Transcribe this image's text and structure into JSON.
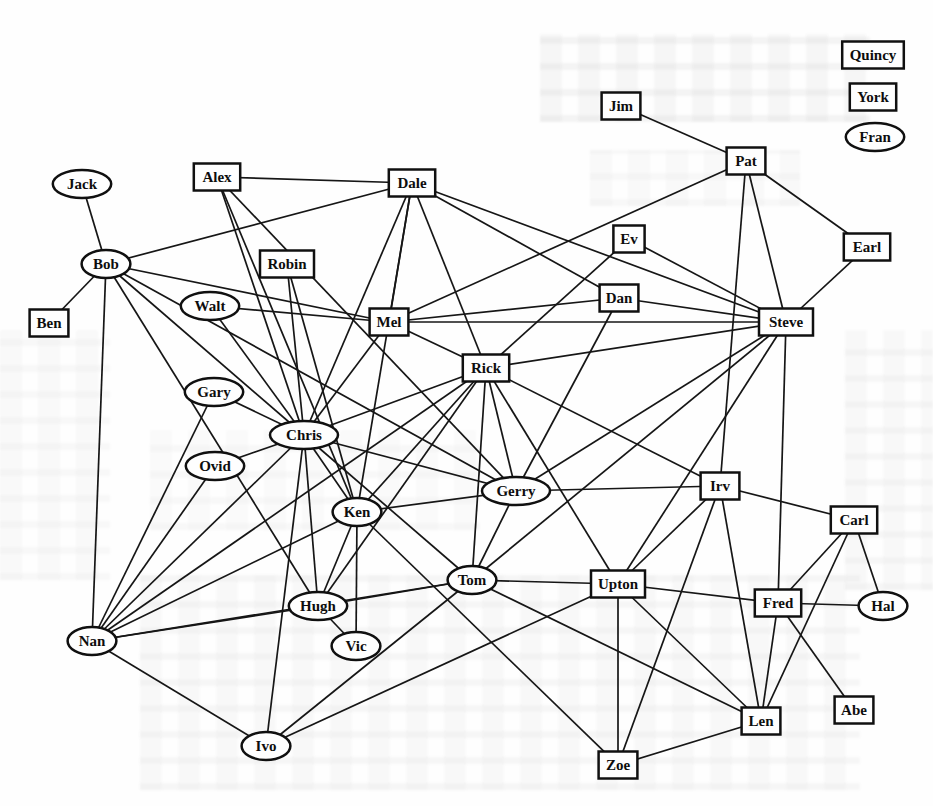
{
  "figure": {
    "kind": "scanned sociogram figure",
    "ink_color": "#161616",
    "paper_color": "#fefefe",
    "node_shapes_legend": "rectangle and ellipse node styles"
  },
  "graph": {
    "nodes": [
      {
        "id": "quincy",
        "label": "Quincy",
        "shape": "rect",
        "x": 873,
        "y": 55
      },
      {
        "id": "york",
        "label": "York",
        "shape": "rect",
        "x": 873,
        "y": 97
      },
      {
        "id": "fran",
        "label": "Fran",
        "shape": "ellipse",
        "x": 875,
        "y": 137
      },
      {
        "id": "jim",
        "label": "Jim",
        "shape": "rect",
        "x": 621,
        "y": 106
      },
      {
        "id": "pat",
        "label": "Pat",
        "shape": "rect",
        "x": 746,
        "y": 161
      },
      {
        "id": "jack",
        "label": "Jack",
        "shape": "ellipse",
        "x": 82,
        "y": 184
      },
      {
        "id": "alex",
        "label": "Alex",
        "shape": "rect",
        "x": 217,
        "y": 177
      },
      {
        "id": "dale",
        "label": "Dale",
        "shape": "rect",
        "x": 412,
        "y": 183
      },
      {
        "id": "ev",
        "label": "Ev",
        "shape": "rect",
        "x": 629,
        "y": 239
      },
      {
        "id": "earl",
        "label": "Earl",
        "shape": "rect",
        "x": 867,
        "y": 247
      },
      {
        "id": "bob",
        "label": "Bob",
        "shape": "ellipse",
        "x": 106,
        "y": 264
      },
      {
        "id": "robin",
        "label": "Robin",
        "shape": "rect",
        "x": 287,
        "y": 264
      },
      {
        "id": "ben",
        "label": "Ben",
        "shape": "rect",
        "x": 49,
        "y": 323
      },
      {
        "id": "walt",
        "label": "Walt",
        "shape": "ellipse",
        "x": 210,
        "y": 306
      },
      {
        "id": "mel",
        "label": "Mel",
        "shape": "rect",
        "x": 389,
        "y": 322
      },
      {
        "id": "dan",
        "label": "Dan",
        "shape": "rect",
        "x": 619,
        "y": 298
      },
      {
        "id": "steve",
        "label": "Steve",
        "shape": "rect",
        "x": 786,
        "y": 322
      },
      {
        "id": "rick",
        "label": "Rick",
        "shape": "rect",
        "x": 486,
        "y": 368
      },
      {
        "id": "gary",
        "label": "Gary",
        "shape": "ellipse",
        "x": 214,
        "y": 392
      },
      {
        "id": "chris",
        "label": "Chris",
        "shape": "ellipse",
        "x": 304,
        "y": 435
      },
      {
        "id": "ovid",
        "label": "Ovid",
        "shape": "ellipse",
        "x": 215,
        "y": 466
      },
      {
        "id": "ken",
        "label": "Ken",
        "shape": "ellipse",
        "x": 357,
        "y": 512
      },
      {
        "id": "gerry",
        "label": "Gerry",
        "shape": "ellipse",
        "x": 516,
        "y": 491
      },
      {
        "id": "irv",
        "label": "Irv",
        "shape": "rect",
        "x": 720,
        "y": 486
      },
      {
        "id": "carl",
        "label": "Carl",
        "shape": "rect",
        "x": 854,
        "y": 520
      },
      {
        "id": "tom",
        "label": "Tom",
        "shape": "ellipse",
        "x": 472,
        "y": 580
      },
      {
        "id": "upton",
        "label": "Upton",
        "shape": "rect",
        "x": 618,
        "y": 584
      },
      {
        "id": "fred",
        "label": "Fred",
        "shape": "rect",
        "x": 778,
        "y": 603
      },
      {
        "id": "hal",
        "label": "Hal",
        "shape": "ellipse",
        "x": 883,
        "y": 606
      },
      {
        "id": "hugh",
        "label": "Hugh",
        "shape": "ellipse",
        "x": 318,
        "y": 606
      },
      {
        "id": "nan",
        "label": "Nan",
        "shape": "ellipse",
        "x": 92,
        "y": 641
      },
      {
        "id": "vic",
        "label": "Vic",
        "shape": "ellipse",
        "x": 356,
        "y": 646
      },
      {
        "id": "ivo",
        "label": "Ivo",
        "shape": "ellipse",
        "x": 266,
        "y": 746
      },
      {
        "id": "len",
        "label": "Len",
        "shape": "rect",
        "x": 761,
        "y": 721
      },
      {
        "id": "zoe",
        "label": "Zoe",
        "shape": "rect",
        "x": 618,
        "y": 765
      },
      {
        "id": "abe",
        "label": "Abe",
        "shape": "rect",
        "x": 854,
        "y": 710
      }
    ],
    "edges": [
      [
        "jack",
        "bob"
      ],
      [
        "ben",
        "bob"
      ],
      [
        "bob",
        "dale"
      ],
      [
        "bob",
        "mel"
      ],
      [
        "bob",
        "nan"
      ],
      [
        "bob",
        "chris"
      ],
      [
        "bob",
        "hugh"
      ],
      [
        "bob",
        "gerry"
      ],
      [
        "alex",
        "dale"
      ],
      [
        "alex",
        "chris"
      ],
      [
        "alex",
        "ken"
      ],
      [
        "alex",
        "gerry"
      ],
      [
        "dale",
        "mel"
      ],
      [
        "dale",
        "chris"
      ],
      [
        "dale",
        "ken"
      ],
      [
        "dale",
        "rick"
      ],
      [
        "dale",
        "dan"
      ],
      [
        "dale",
        "steve"
      ],
      [
        "pat",
        "jim"
      ],
      [
        "pat",
        "earl"
      ],
      [
        "pat",
        "mel"
      ],
      [
        "pat",
        "steve"
      ],
      [
        "pat",
        "irv"
      ],
      [
        "earl",
        "steve"
      ],
      [
        "ev",
        "steve"
      ],
      [
        "ev",
        "rick"
      ],
      [
        "dan",
        "mel"
      ],
      [
        "dan",
        "steve"
      ],
      [
        "dan",
        "gerry"
      ],
      [
        "mel",
        "steve"
      ],
      [
        "mel",
        "rick"
      ],
      [
        "mel",
        "chris"
      ],
      [
        "mel",
        "walt"
      ],
      [
        "rick",
        "steve"
      ],
      [
        "rick",
        "gerry"
      ],
      [
        "rick",
        "tom"
      ],
      [
        "rick",
        "irv"
      ],
      [
        "rick",
        "ken"
      ],
      [
        "rick",
        "chris"
      ],
      [
        "rick",
        "nan"
      ],
      [
        "rick",
        "upton"
      ],
      [
        "rick",
        "hugh"
      ],
      [
        "gary",
        "chris"
      ],
      [
        "gary",
        "nan"
      ],
      [
        "ovid",
        "chris"
      ],
      [
        "ovid",
        "nan"
      ],
      [
        "chris",
        "ken"
      ],
      [
        "chris",
        "ivo"
      ],
      [
        "chris",
        "nan"
      ],
      [
        "chris",
        "walt"
      ],
      [
        "chris",
        "robin"
      ],
      [
        "chris",
        "tom"
      ],
      [
        "chris",
        "gerry"
      ],
      [
        "chris",
        "hugh"
      ],
      [
        "robin",
        "ken"
      ],
      [
        "ken",
        "hugh"
      ],
      [
        "ken",
        "vic"
      ],
      [
        "ken",
        "gerry"
      ],
      [
        "ken",
        "zoe"
      ],
      [
        "ken",
        "nan"
      ],
      [
        "gerry",
        "irv"
      ],
      [
        "gerry",
        "steve"
      ],
      [
        "gerry",
        "tom"
      ],
      [
        "tom",
        "hugh"
      ],
      [
        "tom",
        "nan"
      ],
      [
        "tom",
        "ivo"
      ],
      [
        "tom",
        "upton"
      ],
      [
        "tom",
        "len"
      ],
      [
        "tom",
        "steve"
      ],
      [
        "hugh",
        "vic"
      ],
      [
        "hugh",
        "nan"
      ],
      [
        "nan",
        "ivo"
      ],
      [
        "ivo",
        "upton"
      ],
      [
        "upton",
        "fred"
      ],
      [
        "upton",
        "zoe"
      ],
      [
        "upton",
        "len"
      ],
      [
        "upton",
        "irv"
      ],
      [
        "upton",
        "steve"
      ],
      [
        "fred",
        "hal"
      ],
      [
        "fred",
        "carl"
      ],
      [
        "fred",
        "abe"
      ],
      [
        "fred",
        "len"
      ],
      [
        "fred",
        "steve"
      ],
      [
        "carl",
        "irv"
      ],
      [
        "carl",
        "hal"
      ],
      [
        "carl",
        "len"
      ],
      [
        "irv",
        "len"
      ],
      [
        "irv",
        "zoe"
      ],
      [
        "zoe",
        "len"
      ]
    ]
  }
}
